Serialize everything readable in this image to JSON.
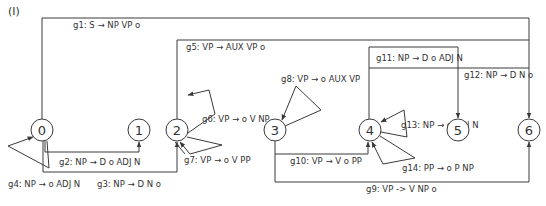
{
  "panel_label": "(I)",
  "nodes": [
    {
      "id": "0",
      "label": "0"
    },
    {
      "id": "1",
      "label": "1"
    },
    {
      "id": "2",
      "label": "2"
    },
    {
      "id": "3",
      "label": "3"
    },
    {
      "id": "4",
      "label": "4"
    },
    {
      "id": "5",
      "label": "5"
    },
    {
      "id": "6",
      "label": "6"
    }
  ],
  "edges": [
    {
      "id": "g1",
      "label": "g1: S → NP VP o",
      "from": "0",
      "to": "6"
    },
    {
      "id": "g2",
      "label": "g2: NP → D o ADJ N",
      "from": "0",
      "to": "1"
    },
    {
      "id": "g3",
      "label": "g3: NP → D N o",
      "from": "0",
      "to": "2"
    },
    {
      "id": "g4",
      "label": "g4: NP → o ADJ N",
      "from": "0",
      "to": "0"
    },
    {
      "id": "g5",
      "label": "g5: VP → AUX VP o",
      "from": "2",
      "to": "6"
    },
    {
      "id": "g6",
      "label": "g6: VP → o V NP",
      "from": "2",
      "to": "2"
    },
    {
      "id": "g7",
      "label": "g7: VP → o V PP",
      "from": "2",
      "to": "2"
    },
    {
      "id": "g8",
      "label": "g8: VP → o AUX VP",
      "from": "3",
      "to": "3"
    },
    {
      "id": "g9",
      "label": "g9: VP -> V NP o",
      "from": "3",
      "to": "6"
    },
    {
      "id": "g10",
      "label": "g10: VP → V o PP",
      "from": "3",
      "to": "4"
    },
    {
      "id": "g11",
      "label": "g11: NP → D o ADJ N",
      "from": "4",
      "to": "5"
    },
    {
      "id": "g12",
      "label": "g12: NP → D N o",
      "from": "4",
      "to": "6"
    },
    {
      "id": "g13",
      "label": "g13: NP → o ADJ N",
      "from": "4",
      "to": "4"
    },
    {
      "id": "g14",
      "label": "g14: PP → o P NP",
      "from": "4",
      "to": "4"
    }
  ]
}
